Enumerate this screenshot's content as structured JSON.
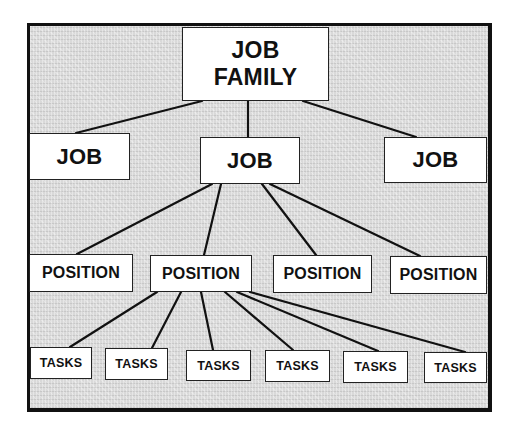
{
  "diagram": {
    "type": "hierarchy-tree",
    "colors": {
      "background": "#d9d9d9",
      "box_fill": "#ffffff",
      "line": "#111111"
    },
    "root": {
      "id": "family",
      "label_line1": "JOB",
      "label_line2": "FAMILY"
    },
    "jobs": [
      {
        "id": "job1",
        "label": "JOB"
      },
      {
        "id": "job2",
        "label": "JOB"
      },
      {
        "id": "job3",
        "label": "JOB"
      }
    ],
    "positions": [
      {
        "id": "pos1",
        "label": "POSITION",
        "parent": "job2"
      },
      {
        "id": "pos2",
        "label": "POSITION",
        "parent": "job2"
      },
      {
        "id": "pos3",
        "label": "POSITION",
        "parent": "job2"
      },
      {
        "id": "pos4",
        "label": "POSITION",
        "parent": "job2"
      }
    ],
    "tasks": [
      {
        "id": "task1",
        "label": "TASKS",
        "parent": "pos2"
      },
      {
        "id": "task2",
        "label": "TASKS",
        "parent": "pos2"
      },
      {
        "id": "task3",
        "label": "TASKS",
        "parent": "pos2"
      },
      {
        "id": "task4",
        "label": "TASKS",
        "parent": "pos2"
      },
      {
        "id": "task5",
        "label": "TASKS",
        "parent": "pos2"
      },
      {
        "id": "task6",
        "label": "TASKS",
        "parent": "pos2"
      }
    ]
  }
}
